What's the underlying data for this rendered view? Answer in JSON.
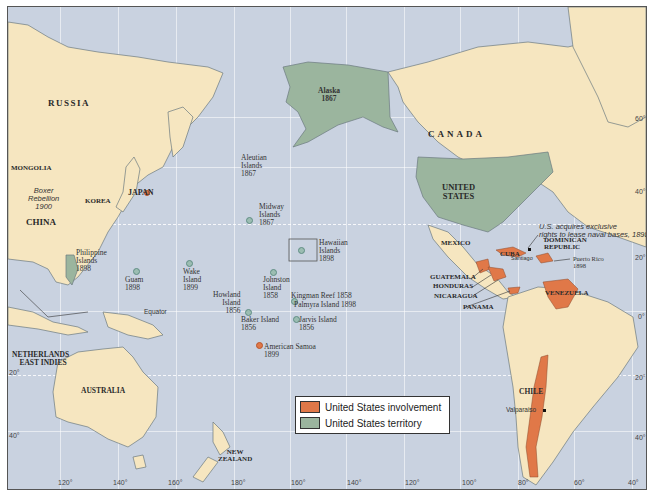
{
  "map": {
    "countries": {
      "russia": "RUSSIA",
      "mongolia": "MONGOLIA",
      "china": "CHINA",
      "korea": "KOREA",
      "japan": "JAPAN",
      "netherlands_east_indies_1": "NETHERLANDS",
      "netherlands_east_indies_2": "EAST INDIES",
      "australia": "AUSTRALIA",
      "new_zealand_1": "NEW",
      "new_zealand_2": "ZEALAND",
      "canada": "CANADA",
      "united_states_1": "UNITED",
      "united_states_2": "STATES",
      "mexico": "MEXICO",
      "cuba": "CUBA",
      "dominican_republic_1": "DOMINICAN",
      "dominican_republic_2": "REPUBLIC",
      "guatemala": "GUATEMALA",
      "honduras": "HONDURAS",
      "nicaragua": "NICARAGUA",
      "panama": "PANAMA",
      "venezuela": "VENEZUELA",
      "chile": "CHILE"
    },
    "events": {
      "boxer_1": "Boxer",
      "boxer_2": "Rebellion",
      "boxer_3": "1900",
      "naval_1": "U.S. acquires exclusive",
      "naval_2": "rights to lease naval bases, 1898"
    },
    "territories": {
      "alaska": {
        "name": "Alaska",
        "year": "1867"
      },
      "aleutian": {
        "name1": "Aleutian",
        "name2": "Islands",
        "year": "1867"
      },
      "midway": {
        "name1": "Midway",
        "name2": "Islands",
        "year": "1867"
      },
      "hawaiian": {
        "name1": "Hawaiian",
        "name2": "Islands",
        "year": "1898"
      },
      "philippine": {
        "name1": "Philippine",
        "name2": "Islands",
        "year": "1898"
      },
      "guam": {
        "name": "Guam",
        "year": "1898"
      },
      "wake": {
        "name1": "Wake",
        "name2": "Island",
        "year": "1899"
      },
      "johnston": {
        "name1": "Johnston",
        "name2": "Island",
        "year": "1858"
      },
      "howland": {
        "name1": "Howland",
        "name2": "Island",
        "year": "1856"
      },
      "baker": {
        "name": "Baker Island",
        "year": "1856"
      },
      "kingman": "Kingman Reef 1858",
      "palmyra": "Palmyra Island 1898",
      "jarvis": {
        "name": "Jarvis Island",
        "year": "1856"
      },
      "samoa": {
        "name": "American Samoa",
        "year": "1899"
      },
      "puerto_rico": {
        "name": "Puerto Rico",
        "year": "1898"
      }
    },
    "cities": {
      "santiago": "Santiago",
      "valparaiso": "Valparaiso"
    },
    "equator": "Equator",
    "lat_ticks_right": [
      "60°",
      "40°",
      "20°",
      "0°",
      "20°",
      "40°"
    ],
    "lat_ticks_left": [
      "20°",
      "40°"
    ],
    "lon_ticks": [
      "120°",
      "140°",
      "160°",
      "180°",
      "160°",
      "140°",
      "120°",
      "100°",
      "80°",
      "60°",
      "40°"
    ]
  },
  "legend": {
    "items": [
      {
        "label": "United States involvement",
        "color": "#e07848"
      },
      {
        "label": "United States territory",
        "color": "#9bb59e"
      }
    ]
  },
  "colors": {
    "ocean": "#c9d2e0",
    "land": "#f6e6c0",
    "us_territory": "#9bb59e",
    "us_involvement": "#e07848",
    "border": "#6b7a80"
  }
}
